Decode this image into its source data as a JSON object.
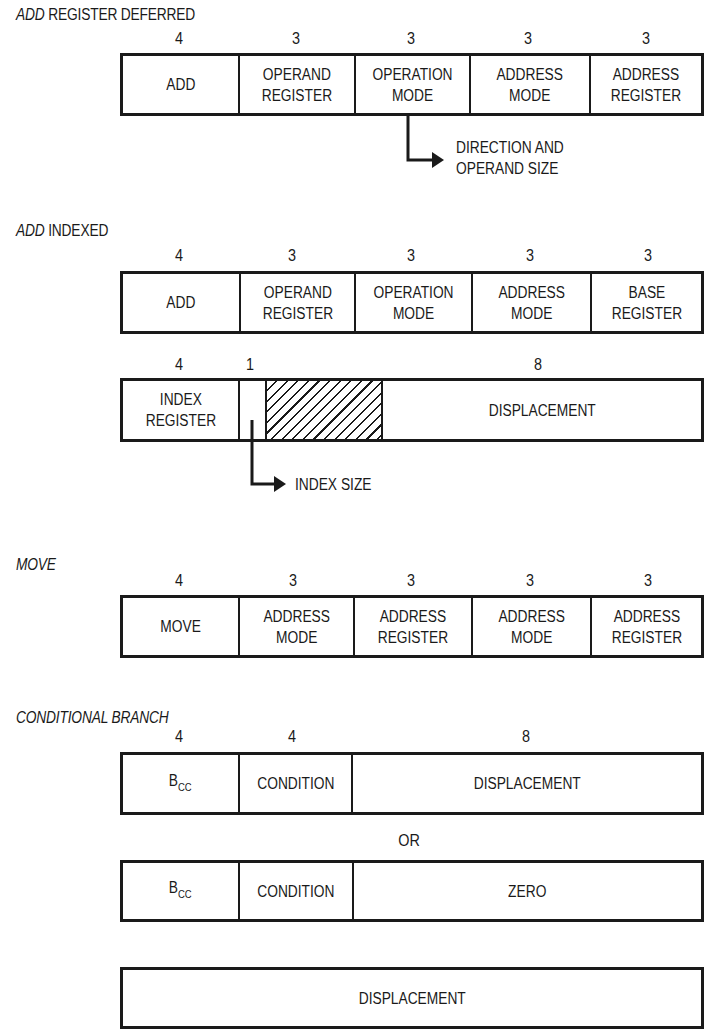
{
  "sections": {
    "add_register_deferred": {
      "title_italic": "ADD",
      "title_rest": " REGISTER DEFERRED",
      "bit_widths": [
        "4",
        "3",
        "3",
        "3",
        "3"
      ],
      "fields": [
        "ADD",
        "OPERAND\nREGISTER",
        "OPERATION\nMODE",
        "ADDRESS\nMODE",
        "ADDRESS\nREGISTER"
      ],
      "annotation": "DIRECTION AND\nOPERAND SIZE"
    },
    "add_indexed": {
      "title_italic": "ADD",
      "title_rest": " INDEXED",
      "bit_widths": [
        "4",
        "3",
        "3",
        "3",
        "3"
      ],
      "fields": [
        "ADD",
        "OPERAND\nREGISTER",
        "OPERATION\nMODE",
        "ADDRESS\nMODE",
        "BASE\nREGISTER"
      ],
      "ext_bit_widths": [
        "4",
        "1",
        "8"
      ],
      "ext_fields": [
        "INDEX\nREGISTER",
        "",
        "",
        "DISPLACEMENT"
      ],
      "annotation": "INDEX SIZE"
    },
    "move": {
      "title_italic": "MOVE",
      "bit_widths": [
        "4",
        "3",
        "3",
        "3",
        "3"
      ],
      "fields": [
        "MOVE",
        "ADDRESS\nMODE",
        "ADDRESS\nREGISTER",
        "ADDRESS\nMODE",
        "ADDRESS\nREGISTER"
      ]
    },
    "conditional_branch": {
      "title_italic": "CONDITIONAL BRANCH",
      "bit_widths": [
        "4",
        "4",
        "8"
      ],
      "row1": {
        "bcc_main": "B",
        "bcc_sub": "CC",
        "condition": "CONDITION",
        "displacement": "DISPLACEMENT"
      },
      "or_label": "OR",
      "row2": {
        "bcc_main": "B",
        "bcc_sub": "CC",
        "condition": "CONDITION",
        "zero": "ZERO"
      },
      "row3": {
        "displacement": "DISPLACEMENT"
      }
    }
  },
  "colors": {
    "ink": "#1a1a1a",
    "paper": "#ffffff"
  }
}
